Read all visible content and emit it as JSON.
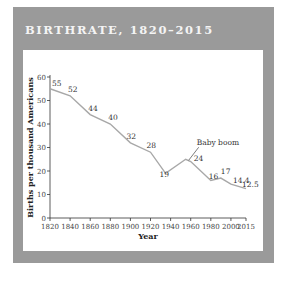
{
  "header": {
    "title": "BIRTHRATE, 1820–2015"
  },
  "colors": {
    "frame": "#9a9a9a",
    "line": "#a8a8a8",
    "axis": "#333333",
    "title_text": "#f4f4f4"
  },
  "chart_data": {
    "type": "line",
    "title": "BIRTHRATE, 1820–2015",
    "xlabel": "Year",
    "ylabel": "Births per thousand Americans",
    "ylim": [
      0,
      60
    ],
    "xlim": [
      1820,
      2015
    ],
    "yticks": [
      0,
      10,
      20,
      30,
      40,
      50,
      60
    ],
    "xticks": [
      1820,
      1840,
      1860,
      1880,
      1900,
      1920,
      1940,
      1960,
      1980,
      2000,
      2015
    ],
    "grid": false,
    "series": [
      {
        "name": "Birthrate",
        "points": [
          {
            "x": 1820,
            "y": 55,
            "label": "55"
          },
          {
            "x": 1840,
            "y": 52,
            "label": "52"
          },
          {
            "x": 1860,
            "y": 44,
            "label": "44"
          },
          {
            "x": 1880,
            "y": 40,
            "label": "40"
          },
          {
            "x": 1900,
            "y": 32,
            "label": "32"
          },
          {
            "x": 1920,
            "y": 28,
            "label": "28"
          },
          {
            "x": 1935,
            "y": 19,
            "label": "19"
          },
          {
            "x": 1955,
            "y": 25,
            "label": ""
          },
          {
            "x": 1960,
            "y": 24,
            "label": "24"
          },
          {
            "x": 1980,
            "y": 16,
            "label": "16"
          },
          {
            "x": 1990,
            "y": 17,
            "label": "17"
          },
          {
            "x": 2000,
            "y": 14.4,
            "label": "14.4"
          },
          {
            "x": 2015,
            "y": 12.5,
            "label": "12.5"
          }
        ]
      }
    ],
    "annotations": [
      {
        "text": "Baby boom",
        "x": 1955,
        "y": 25
      }
    ]
  }
}
